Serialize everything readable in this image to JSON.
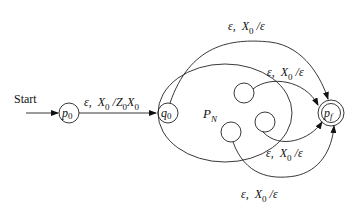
{
  "diagram": {
    "type": "pushdown-automaton-construction",
    "start_label": "Start",
    "states": {
      "p0": {
        "label": "p",
        "sub": "0"
      },
      "q0": {
        "label": "q",
        "sub": "0"
      },
      "pf": {
        "label": "p",
        "sub": "f",
        "accepting": true
      }
    },
    "region": {
      "label": "P",
      "sub": "N"
    },
    "transitions": {
      "p0_q0": {
        "eps": "ε,",
        "x": "X",
        "xsub": "0",
        "slash": "/Z",
        "zsub": "0",
        "tail": "X",
        "tailsub": "0"
      },
      "top": {
        "eps": "ε,",
        "x": "X",
        "xsub": "0",
        "rest": "/ε"
      },
      "mid_upper": {
        "eps": "ε,",
        "x": "X",
        "xsub": "0",
        "rest": "/ε"
      },
      "mid_lower": {
        "eps": "ε,",
        "x": "X",
        "xsub": "0",
        "rest": "/ε"
      },
      "bottom": {
        "eps": "ε,",
        "x": "X",
        "xsub": "0",
        "rest": "/ε"
      }
    }
  }
}
